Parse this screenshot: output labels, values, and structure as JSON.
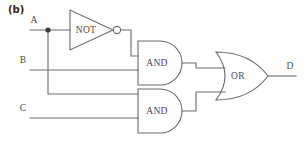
{
  "figure": {
    "panel_label": "(b)",
    "stroke_color": "#6b6b6b",
    "text_color": "#4a4a4a",
    "background_color": "#fefefe"
  },
  "inputs": [
    {
      "id": "A",
      "label": "A",
      "y": 30
    },
    {
      "id": "B",
      "label": "B",
      "y": 70
    },
    {
      "id": "C",
      "label": "C",
      "y": 118
    }
  ],
  "outputs": [
    {
      "id": "D",
      "label": "D",
      "y": 76
    }
  ],
  "gates": [
    {
      "id": "not1",
      "type": "NOT",
      "label": "NOT",
      "inputs": [
        "A"
      ],
      "output": "notA"
    },
    {
      "id": "and1",
      "type": "AND",
      "label": "AND",
      "inputs": [
        "notA",
        "B"
      ],
      "output": "and1out"
    },
    {
      "id": "and2",
      "type": "AND",
      "label": "AND",
      "inputs": [
        "A",
        "C"
      ],
      "output": "and2out"
    },
    {
      "id": "or1",
      "type": "OR",
      "label": "OR",
      "inputs": [
        "and1out",
        "and2out"
      ],
      "output": "D"
    }
  ],
  "junctions": [
    {
      "id": "j-A",
      "x": 48,
      "y": 30
    }
  ]
}
